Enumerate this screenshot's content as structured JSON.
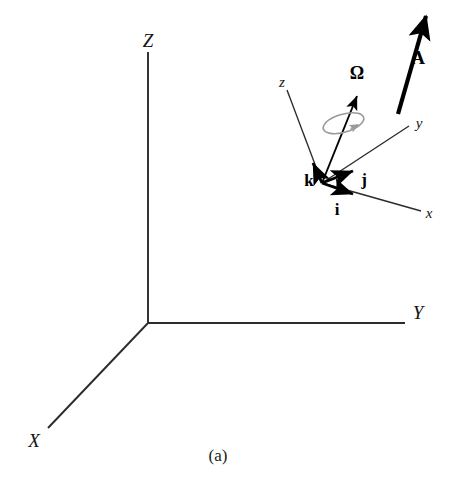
{
  "figure": {
    "caption": "(a)",
    "caption_pos": {
      "x": 218,
      "y": 455
    },
    "width": 451,
    "height": 488,
    "background_color": "#ffffff"
  },
  "colors": {
    "axis_line": "#2b2b2b",
    "vector_bold": "#000000",
    "spin_ellipse": "#9a9a9a",
    "text": "#141414"
  },
  "global_frame": {
    "name": "space-fixed-frame",
    "origin": {
      "x": 148,
      "y": 323
    },
    "axes": [
      {
        "id": "Z",
        "label": "Z",
        "label_pos": {
          "x": 148,
          "y": 40
        },
        "end": {
          "x": 148,
          "y": 52
        },
        "orientation": "vertical-up"
      },
      {
        "id": "Y",
        "label": "Y",
        "label_pos": {
          "x": 418,
          "y": 312
        },
        "end": {
          "x": 405,
          "y": 323
        },
        "orientation": "horizontal-right"
      },
      {
        "id": "X",
        "label": "X",
        "label_pos": {
          "x": 34,
          "y": 440
        },
        "end": {
          "x": 48,
          "y": 428
        },
        "orientation": "diagonal-down-left"
      }
    ]
  },
  "body_frame": {
    "name": "body-fixed-rotating-frame",
    "origin": {
      "x": 322,
      "y": 183
    },
    "axes": [
      {
        "id": "z",
        "label": "z",
        "label_pos": {
          "x": 282,
          "y": 82
        },
        "end": {
          "x": 287,
          "y": 90
        }
      },
      {
        "id": "y",
        "label": "y",
        "label_pos": {
          "x": 419,
          "y": 123
        },
        "end": {
          "x": 409,
          "y": 126
        }
      },
      {
        "id": "x",
        "label": "x",
        "label_pos": {
          "x": 429,
          "y": 213
        },
        "end": {
          "x": 421,
          "y": 211
        }
      }
    ],
    "unit_vectors": [
      {
        "id": "k",
        "label": "k",
        "label_pos": {
          "x": 309,
          "y": 180
        },
        "tip": {
          "x": 312,
          "y": 159
        },
        "description": "unit vector along body z"
      },
      {
        "id": "j",
        "label": "j",
        "label_pos": {
          "x": 364,
          "y": 179
        },
        "tip": {
          "x": 356,
          "y": 167
        },
        "description": "unit vector along body y"
      },
      {
        "id": "i",
        "label": "i",
        "label_pos": {
          "x": 337,
          "y": 209
        },
        "tip": {
          "x": 357,
          "y": 196
        },
        "description": "unit vector along body x"
      }
    ]
  },
  "angular_velocity": {
    "id": "Omega",
    "label": "Ω",
    "label_pos": {
      "x": 357,
      "y": 73
    },
    "tail": {
      "x": 322,
      "y": 183
    },
    "tip": {
      "x": 357,
      "y": 92
    },
    "spin_indicator": {
      "name": "rotation-ellipse",
      "center": {
        "x": 341,
        "y": 124
      },
      "rx": 21,
      "ry": 9,
      "rotation_deg": -16,
      "color": "#9a9a9a"
    }
  },
  "vector_A": {
    "id": "A",
    "label": "A",
    "label_pos": {
      "x": 418,
      "y": 57
    },
    "tail": {
      "x": 398,
      "y": 114
    },
    "tip": {
      "x": 428,
      "y": 9
    },
    "stroke_width": 4.2,
    "color": "#000000"
  }
}
